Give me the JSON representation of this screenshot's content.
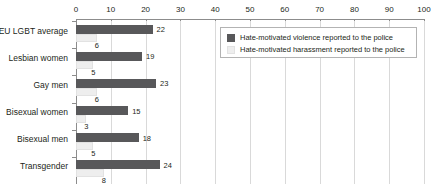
{
  "chart_data": {
    "type": "bar",
    "orientation": "horizontal",
    "title": "",
    "xlabel": "",
    "ylabel": "",
    "xlim": [
      0,
      100
    ],
    "xticks": [
      0,
      10,
      20,
      30,
      40,
      50,
      60,
      70,
      80,
      90,
      100
    ],
    "xtick_labels": [
      "0",
      "10",
      "20",
      "30",
      "40",
      "50",
      "60",
      "70",
      "80",
      "90",
      "100"
    ],
    "grid": true,
    "axis_position": "top",
    "legend_position": "top-right",
    "categories": [
      "EU LGBT average",
      "Lesbian women",
      "Gay men",
      "Bisexual women",
      "Bisexual men",
      "Transgender"
    ],
    "series": [
      {
        "name": "Hate-motivated violence reported to the police",
        "color": "#58585a",
        "values": [
          22,
          19,
          23,
          15,
          18,
          24
        ],
        "value_labels": [
          "22",
          "19",
          "23",
          "15",
          "18",
          "24"
        ]
      },
      {
        "name": "Hate-motivated harassment reported to the police",
        "color": "#eeeeee",
        "values": [
          6,
          5,
          6,
          3,
          5,
          8
        ],
        "value_labels": [
          "6",
          "5",
          "6",
          "3",
          "5",
          "8"
        ]
      }
    ]
  },
  "legend": {
    "entries": [
      {
        "label": "Hate-motivated violence reported to the police",
        "swatch": "violence-swatch"
      },
      {
        "label": "Hate-motivated harassment reported to the police",
        "swatch": "harassment-swatch"
      }
    ]
  },
  "colors": {
    "violence": "#58585a",
    "harassment": "#eeeeee",
    "gridline": "#d9d9d9",
    "axis": "#8c8c8c",
    "text": "#231f20",
    "background": "#ffffff"
  }
}
